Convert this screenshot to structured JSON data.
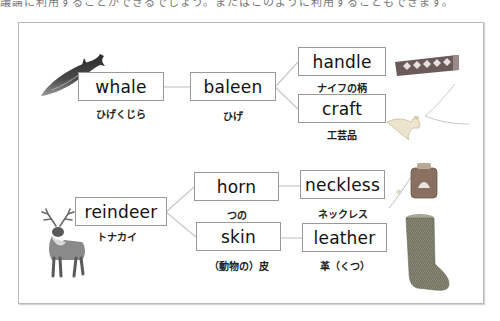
{
  "top_text": "議論に利用することができるでしょう。またはこのように利用することもできます。",
  "diagram": {
    "whale": {
      "en": "whale",
      "ja": "ひげくじら"
    },
    "baleen": {
      "en": "baleen",
      "ja": "ひげ"
    },
    "handle": {
      "en": "handle",
      "ja": "ナイフの柄"
    },
    "craft": {
      "en": "craft",
      "ja": "工芸品"
    },
    "reindeer": {
      "en": "reindeer",
      "ja": "トナカイ"
    },
    "horn": {
      "en": "horn",
      "ja": "つの"
    },
    "skin": {
      "en": "skin",
      "ja": "（動物の）皮"
    },
    "neckless": {
      "en": "neckless",
      "ja": "ネックレス"
    },
    "leather": {
      "en": "leather",
      "ja": "革（くつ）"
    }
  },
  "images": {
    "whale": "whale-illustration",
    "knife_handle": "wrapped-knife-handle",
    "craft": "whale-tail-pendant",
    "reindeer": "reindeer-figurine",
    "neckless": "pendant-necklace",
    "leather": "fur-boot"
  },
  "colors": {
    "box_border": "#9a9a9a",
    "line": "#c8c8c8",
    "frame": "#b8b8b8"
  }
}
